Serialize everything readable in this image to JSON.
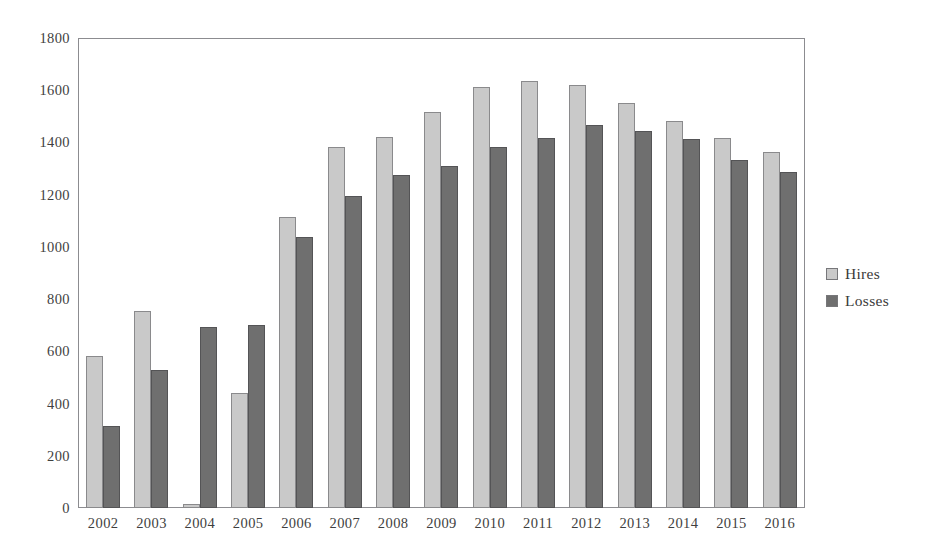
{
  "chart_data": {
    "type": "bar",
    "title": "",
    "subtitle": "",
    "xlabel": "",
    "ylabel": "",
    "ylim": [
      0,
      1800
    ],
    "ytick_step": 200,
    "yticks": [
      "1800",
      "1600",
      "1400",
      "1200",
      "1000",
      "800",
      "600",
      "400",
      "200",
      "0"
    ],
    "grid": false,
    "legend_position": "right",
    "categories": [
      "2002",
      "2003",
      "2004",
      "2005",
      "2006",
      "2007",
      "2008",
      "2009",
      "2010",
      "2011",
      "2012",
      "2013",
      "2014",
      "2015",
      "2016"
    ],
    "series": [
      {
        "name": "Hires",
        "color": "#c9c9c9",
        "values": [
          582,
          755,
          15,
          440,
          1118,
          1387,
          1423,
          1518,
          1615,
          1637,
          1622,
          1553,
          1487,
          1421,
          1367
        ]
      },
      {
        "name": "Losses",
        "color": "#6f6f6f",
        "values": [
          313,
          531,
          695,
          703,
          1040,
          1196,
          1279,
          1312,
          1384,
          1419,
          1471,
          1448,
          1417,
          1336,
          1288
        ]
      }
    ]
  },
  "legend": {
    "entries": [
      {
        "label": "Hires",
        "swatch": "hires"
      },
      {
        "label": "Losses",
        "swatch": "losses"
      }
    ]
  }
}
